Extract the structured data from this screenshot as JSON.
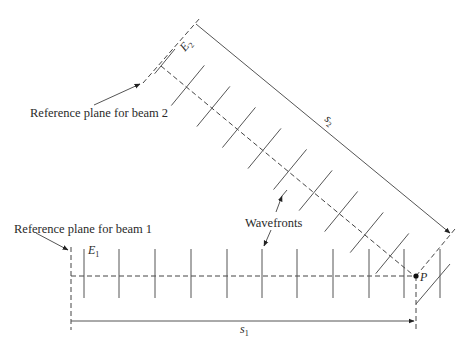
{
  "figure": {
    "labels": {
      "ref_plane_beam2": "Reference plane for beam 2",
      "ref_plane_beam1": "Reference plane for beam 1",
      "wavefronts": "Wavefronts",
      "E1_main": "E",
      "E1_sub": "1",
      "E2_main": "E",
      "E2_sub": "2",
      "s1_main": "s",
      "s1_sub": "1",
      "s2_main": "s",
      "s2_sub": "2",
      "point_P": "P"
    },
    "beam1": {
      "reference_plane_x": 71,
      "axis_y": 276,
      "wavefront_x": [
        84,
        119,
        155,
        191,
        227,
        262,
        297,
        333,
        369,
        404,
        440
      ],
      "wavefront_y_range": [
        249,
        298
      ]
    },
    "beam2": {
      "start": [
        161,
        66
      ],
      "end": [
        414,
        274
      ],
      "wavefront_count": 10
    },
    "point_P": [
      416,
      276
    ],
    "colors": {
      "line": "#555555",
      "text": "#2a2a2a",
      "background": "#ffffff"
    }
  }
}
